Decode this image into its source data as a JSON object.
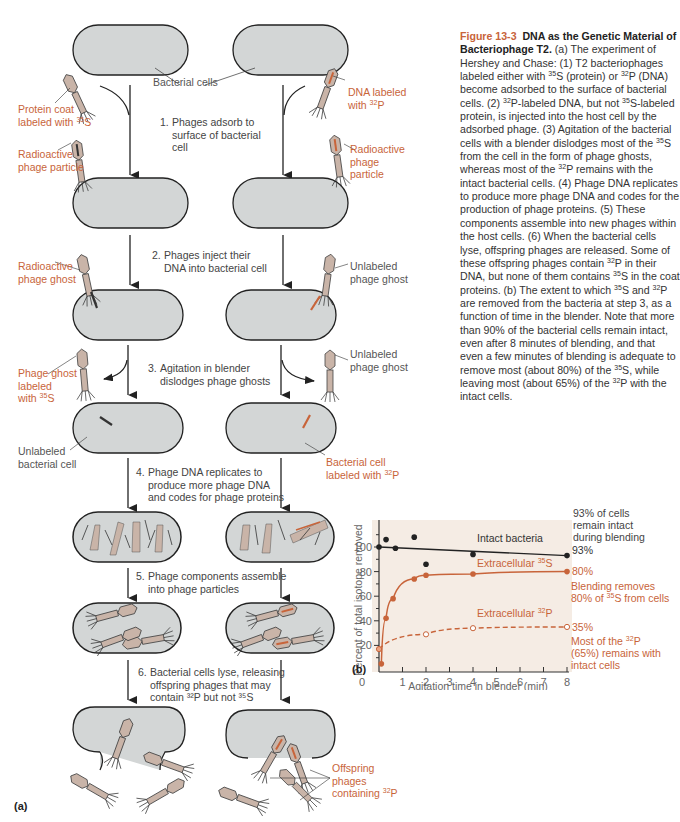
{
  "caption": {
    "figure_number": "Figure 13-3",
    "title": "DNA as the Genetic Material of Bacteriophage T2.",
    "segments": [
      {
        "t": " (a) The experiment of Hershey and Chase: (1) T2 bacteriophages labeled either with "
      },
      {
        "sup": "35"
      },
      {
        "t": "S (protein) or "
      },
      {
        "sup": "32"
      },
      {
        "t": "P (DNA) become adsorbed to the surface of bacterial cells. (2) "
      },
      {
        "sup": "32"
      },
      {
        "t": "P-labeled DNA, but not "
      },
      {
        "sup": "35"
      },
      {
        "t": "S-labeled protein, is injected into the host cell by the adsorbed phage. (3) Agitation of the bacterial cells with a blender dislodges most of the "
      },
      {
        "sup": "35"
      },
      {
        "t": "S from the cell in the form of phage ghosts, whereas most of the "
      },
      {
        "sup": "32"
      },
      {
        "t": "P remains with the intact bacterial cells. (4) Phage DNA replicates to produce more phage DNA and codes for the production of phage proteins. (5) These components assemble into new phages within the host cells. (6) When the bacterial cells lyse, offspring phages are released. Some of these offspring phages contain "
      },
      {
        "sup": "32"
      },
      {
        "t": "P in their DNA, but none of them contains "
      },
      {
        "sup": "35"
      },
      {
        "t": "S in the coat proteins. (b) The extent to which "
      },
      {
        "sup": "35"
      },
      {
        "t": "S and "
      },
      {
        "sup": "32"
      },
      {
        "t": "P are removed from the bacteria at step 3, as a function of time in the blender. Note that more than 90% of the bacterial cells remain intact, even after 8 minutes of blending, and that even a few minutes of blending is adequate to remove most (about 80%) of the "
      },
      {
        "sup": "35"
      },
      {
        "t": "S, while leaving most (about 65%) of the "
      },
      {
        "sup": "32"
      },
      {
        "t": "P with the intact cells."
      }
    ]
  },
  "panel_a": {
    "label": "(a)",
    "steps": [
      {
        "num": "1.",
        "line1": "Phages adsorb to",
        "rest": [
          "surface of bacterial",
          "cell"
        ]
      },
      {
        "num": "2.",
        "line1": "Phages inject their",
        "rest": [
          "DNA into bacterial cell"
        ]
      },
      {
        "num": "3.",
        "line1": "Agitation in blender",
        "rest": [
          "dislodges phage ghosts"
        ]
      },
      {
        "num": "4.",
        "line1": "Phage DNA replicates to",
        "rest": [
          "produce more phage DNA",
          "and codes for phage proteins"
        ]
      },
      {
        "num": "5.",
        "line1": "Phage components assemble",
        "rest": [
          "into phage particles"
        ]
      },
      {
        "num": "6.",
        "line1": "Bacterial cells lyse, releasing",
        "rest": [
          "offspring phages that may",
          "contain ³²P but not ³⁵S"
        ]
      }
    ],
    "labels": {
      "bacterial_cells": "Bacterial cells",
      "protein_coat_1": "Protein coat",
      "protein_coat_2": "labeled with",
      "protein_coat_iso": "35",
      "protein_coat_el": "S",
      "dna_labeled_1": "DNA labeled",
      "dna_labeled_2": "with",
      "dna_labeled_iso": "32",
      "dna_labeled_el": "P",
      "radioactive_particle_left": [
        "Radioactive",
        "phage particle"
      ],
      "radioactive_particle_right": [
        "Radioactive",
        "phage",
        "particle"
      ],
      "radioactive_ghost": [
        "Radioactive",
        "phage ghost"
      ],
      "unlabeled_ghost_1": [
        "Unlabeled",
        "phage ghost"
      ],
      "unlabeled_ghost_2": [
        "Unlabeled",
        "phage ghost"
      ],
      "phage_ghost_labeled": [
        "Phage ghost",
        "labeled",
        "with"
      ],
      "phage_ghost_iso": "35",
      "phage_ghost_el": "S",
      "unlabeled_cell": [
        "Unlabeled",
        "bacterial cell"
      ],
      "bacterial_cell_labeled": [
        "Bacterial cell",
        "labeled with"
      ],
      "bacterial_cell_iso": "32",
      "bacterial_cell_el": "P",
      "offspring": [
        "Offspring",
        "phages",
        "containing"
      ],
      "offspring_iso": "32",
      "offspring_el": "P"
    }
  },
  "panel_b": {
    "label": "(b)"
  },
  "colors": {
    "accent_orange": "#c8643a",
    "cell_fill": "#d3d6d6",
    "phage_fill": "#c9b4a8",
    "chart_bg": "#f5ece4",
    "black": "#222222"
  },
  "chart_data": {
    "type": "line",
    "title": "",
    "xlabel": "Agitation time in blender (min)",
    "ylabel": "Percent of total isotope removed",
    "xlim": [
      0,
      8
    ],
    "ylim": [
      0,
      110
    ],
    "xticks": [
      0,
      1,
      2,
      3,
      4,
      5,
      6,
      7,
      8
    ],
    "yticks": [
      20,
      40,
      60,
      80,
      100
    ],
    "grid": false,
    "series": [
      {
        "name": "Intact bacteria",
        "style": "solid",
        "color": "#222222",
        "marker": "filled-circle",
        "fit_line": [
          [
            0,
            100
          ],
          [
            8,
            93
          ]
        ],
        "points": [
          [
            0,
            100
          ],
          [
            0.3,
            106
          ],
          [
            0.7,
            99
          ],
          [
            1.5,
            108
          ],
          [
            2,
            86
          ],
          [
            4,
            94
          ],
          [
            8,
            93
          ]
        ],
        "end_label": "93%"
      },
      {
        "name": "Extracellular 35S",
        "style": "solid",
        "color": "#c8643a",
        "marker": "filled-circle",
        "points": [
          [
            0.1,
            5
          ],
          [
            0.3,
            42
          ],
          [
            0.6,
            58
          ],
          [
            1.5,
            74
          ],
          [
            2,
            77
          ],
          [
            4,
            78
          ],
          [
            8,
            80
          ]
        ],
        "end_label": "80%"
      },
      {
        "name": "Extracellular 32P",
        "style": "dashed",
        "color": "#c8643a",
        "marker": "open-circle",
        "points": [
          [
            0,
            17
          ],
          [
            2,
            29
          ],
          [
            4,
            34
          ],
          [
            8,
            35
          ]
        ],
        "end_label": "35%"
      }
    ],
    "annotations": [
      {
        "text": [
          "93% of cells",
          "remain intact",
          "during blending"
        ],
        "color": "#333333"
      },
      {
        "text": [
          "Blending removes",
          "80% of ³⁵S from cells"
        ],
        "color": "#c8643a"
      },
      {
        "text": [
          "Most of the ³²P",
          "(65%) remains with",
          "intact cells"
        ],
        "color": "#c8643a"
      }
    ],
    "series_labels": {
      "intact": "Intact bacteria",
      "s35_pre": "Extracellular ",
      "s35_iso": "35",
      "s35_el": "S",
      "p32_pre": "Extracellular ",
      "p32_iso": "32",
      "p32_el": "P"
    },
    "end_labels": {
      "intact": "93%",
      "s35": "80%",
      "p32": "35%"
    },
    "note_top": [
      "93% of cells",
      "remain intact",
      "during blending"
    ],
    "note_mid_1": "Blending removes",
    "note_mid_2a": "80% of ",
    "note_mid_iso": "35",
    "note_mid_2b": "S from cells",
    "note_bot_1a": "Most of the ",
    "note_bot_iso": "32",
    "note_bot_1b": "P",
    "note_bot_2": "(65%) remains with",
    "note_bot_3": "intact cells",
    "tick_labels_y": [
      "100",
      "80",
      "60",
      "40",
      "20"
    ],
    "tick_labels_x": [
      "0",
      "1",
      "2",
      "3",
      "4",
      "5",
      "6",
      "7",
      "8"
    ]
  }
}
